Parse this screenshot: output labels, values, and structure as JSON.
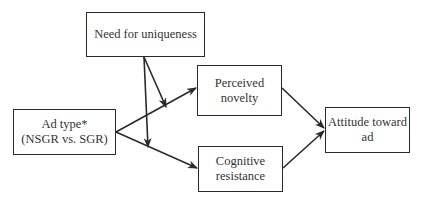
{
  "nodes": {
    "need_for_uniqueness": {
      "lines": [
        "Need for uniqueness"
      ]
    },
    "perceived_novelty": {
      "lines": [
        "Perceived",
        "novelty"
      ]
    },
    "cognitive_resistance": {
      "lines": [
        "Cognitive",
        "resistance"
      ]
    },
    "ad_type": {
      "lines": [
        "Ad type*",
        "(NSGR vs. SGR)"
      ]
    },
    "attitude_toward_ad": {
      "lines": [
        "Attitude toward",
        "ad"
      ]
    }
  },
  "edges": [
    {
      "from": "Ad type*",
      "to": "Perceived novelty",
      "type": "direct"
    },
    {
      "from": "Ad type*",
      "to": "Cognitive resistance",
      "type": "direct"
    },
    {
      "from": "Need for uniqueness",
      "to": "Ad type* → Perceived novelty path",
      "type": "moderation"
    },
    {
      "from": "Need for uniqueness",
      "to": "Ad type* → Cognitive resistance path",
      "type": "moderation"
    },
    {
      "from": "Perceived novelty",
      "to": "Attitude toward ad",
      "type": "direct"
    },
    {
      "from": "Cognitive resistance",
      "to": "Attitude toward ad",
      "type": "direct"
    }
  ],
  "colors": {
    "stroke": "#2a2a2a",
    "text": "#333333",
    "background": "#ffffff"
  }
}
